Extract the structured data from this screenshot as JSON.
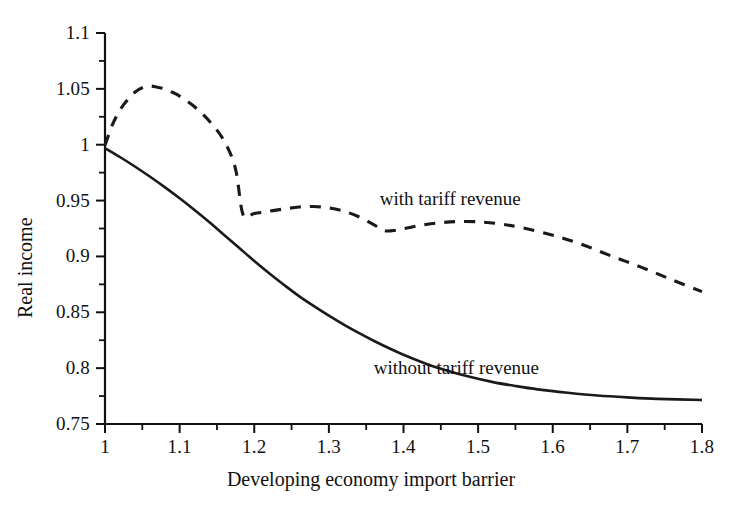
{
  "chart_data": {
    "type": "line",
    "title": "",
    "xlabel": "Developing economy import barrier",
    "ylabel": "Real income",
    "xlim": [
      1,
      1.8
    ],
    "ylim": [
      0.75,
      1.1
    ],
    "grid": false,
    "legend_position": "inline-annotation",
    "x_ticks": [
      "1",
      "1.1",
      "1.2",
      "1.3",
      "1.4",
      "1.5",
      "1.6",
      "1.7",
      "1.8"
    ],
    "x_tick_values": [
      1,
      1.1,
      1.2,
      1.3,
      1.4,
      1.5,
      1.6,
      1.7,
      1.8
    ],
    "x_minor_tick_values": [
      1.05,
      1.15,
      1.25,
      1.35,
      1.45,
      1.55,
      1.65,
      1.75
    ],
    "y_ticks": [
      "1.1",
      "1.05",
      "1",
      "0.95",
      "0.9",
      "0.85",
      "0.8",
      "0.75"
    ],
    "y_tick_values": [
      1.1,
      1.05,
      1.0,
      0.95,
      0.9,
      0.85,
      0.8,
      0.75
    ],
    "y_minor_tick_values": [
      1.075,
      1.025,
      0.975,
      0.925,
      0.875,
      0.825,
      0.775
    ],
    "series": [
      {
        "name": "with tariff revenue",
        "style": "dashed",
        "color": "#1a1a1a",
        "label_x": 1.478,
        "label_y": 0.9505,
        "x": [
          1.0,
          1.01,
          1.02,
          1.03,
          1.04,
          1.05,
          1.06,
          1.07,
          1.08,
          1.09,
          1.1,
          1.12,
          1.14,
          1.16,
          1.175,
          1.185,
          1.2,
          1.22,
          1.24,
          1.26,
          1.28,
          1.3,
          1.32,
          1.34,
          1.36,
          1.375,
          1.39,
          1.41,
          1.43,
          1.45,
          1.47,
          1.5,
          1.53,
          1.56,
          1.6,
          1.64,
          1.68,
          1.72,
          1.76,
          1.8
        ],
        "y": [
          0.9995,
          1.018,
          1.031,
          1.04,
          1.047,
          1.051,
          1.0525,
          1.0515,
          1.05,
          1.047,
          1.0435,
          1.034,
          1.021,
          1.003,
          0.978,
          0.9375,
          0.9385,
          0.9405,
          0.9425,
          0.9442,
          0.9447,
          0.9435,
          0.9405,
          0.9355,
          0.9285,
          0.923,
          0.9235,
          0.9262,
          0.9285,
          0.9302,
          0.9312,
          0.931,
          0.929,
          0.9255,
          0.919,
          0.9105,
          0.9,
          0.89,
          0.879,
          0.8685
        ]
      },
      {
        "name": "without tariff revenue",
        "style": "solid",
        "color": "#1a1a1a",
        "label_x": 1.478,
        "label_y": 0.7995,
        "x": [
          1.0,
          1.02,
          1.04,
          1.06,
          1.08,
          1.1,
          1.12,
          1.14,
          1.16,
          1.18,
          1.2,
          1.22,
          1.24,
          1.26,
          1.28,
          1.3,
          1.32,
          1.34,
          1.36,
          1.38,
          1.4,
          1.43,
          1.46,
          1.49,
          1.52,
          1.55,
          1.58,
          1.62,
          1.66,
          1.7,
          1.74,
          1.8
        ],
        "y": [
          0.997,
          0.989,
          0.9805,
          0.9715,
          0.962,
          0.952,
          0.9415,
          0.9305,
          0.919,
          0.9075,
          0.896,
          0.885,
          0.8745,
          0.8645,
          0.8555,
          0.847,
          0.839,
          0.8315,
          0.8245,
          0.818,
          0.812,
          0.804,
          0.7975,
          0.792,
          0.7875,
          0.784,
          0.781,
          0.778,
          0.7755,
          0.7738,
          0.7725,
          0.7715
        ]
      }
    ]
  },
  "axes": {
    "x_title": "Developing economy import barrier",
    "y_title": "Real income"
  },
  "annotations": {
    "with_tariff": "with tariff revenue",
    "without_tariff": "without tariff revenue"
  },
  "colors": {
    "line": "#1a1a1a",
    "axis": "#111111",
    "background": "#ffffff"
  }
}
